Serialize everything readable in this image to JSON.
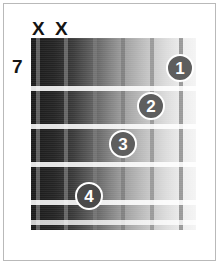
{
  "diagram": {
    "type": "guitar-chord-diagram",
    "title": "",
    "starting_fret_label": "7",
    "string_count": 6,
    "fret_count": 5,
    "mute_marks": [
      {
        "label": "X",
        "string": 1,
        "left": 32,
        "top": 19
      },
      {
        "label": "X",
        "string": 2,
        "left": 55,
        "top": 19
      }
    ],
    "fret_lines": [
      {
        "index": 1,
        "top": 48
      },
      {
        "index": 2,
        "top": 86
      },
      {
        "index": 3,
        "top": 124
      },
      {
        "index": 4,
        "top": 162
      },
      {
        "index": 5,
        "top": 182
      }
    ],
    "strings": [
      {
        "index": 1,
        "left": 5,
        "shade": "dark"
      },
      {
        "index": 2,
        "left": 33,
        "shade": "dark"
      },
      {
        "index": 3,
        "left": 62,
        "shade": "dark"
      },
      {
        "index": 4,
        "left": 90,
        "shade": "dark"
      },
      {
        "index": 5,
        "left": 119,
        "shade": "light"
      },
      {
        "index": 6,
        "left": 148,
        "shade": "light"
      }
    ],
    "finger_positions": [
      {
        "finger": "1",
        "string": 6,
        "fret": 1,
        "left": 166,
        "top": 54
      },
      {
        "finger": "2",
        "string": 5,
        "fret": 2,
        "left": 137,
        "top": 92
      },
      {
        "finger": "3",
        "string": 4,
        "fret": 3,
        "left": 109,
        "top": 130
      },
      {
        "finger": "4",
        "string": 3,
        "fret": 4,
        "left": 75,
        "top": 182
      }
    ],
    "colors": {
      "frame_border": "#b9b9b9",
      "page_background": "#ffffff",
      "fret_line": "#ffffff",
      "string_line": "#969696",
      "dot_fill": "#5e5e5e",
      "dot_text": "#ffffff",
      "label_text": "#161616"
    }
  }
}
